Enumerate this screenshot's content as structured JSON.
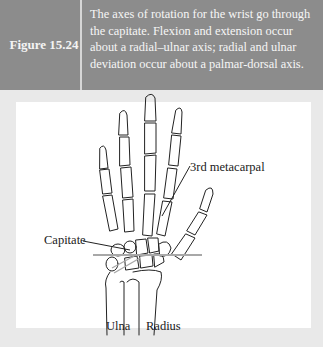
{
  "figure": {
    "number": "Figure 15.24",
    "caption": "The axes of rotation for the wrist go through the capitate. Flexion and extension occur about a radial–ulnar axis; radial and ulnar deviation occur about a palmar-dorsal axis."
  },
  "illustration": {
    "subject": "hand-and-wrist-skeleton-dorsal-view",
    "labels": {
      "metacarpal": "3rd metacarpal",
      "capitate": "Capitate",
      "ulna": "Ulna",
      "radius": "Radius"
    },
    "axis_line_color": "#a8a8a8"
  },
  "colors": {
    "header_bg": "#8c8c8c",
    "frame_bg": "#e9e9e9",
    "panel_bg": "#ffffff",
    "text_light": "#f6f6f6",
    "line": "#222222"
  }
}
